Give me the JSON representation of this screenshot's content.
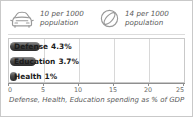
{
  "widget": {
    "border_color": "#c9c9c9",
    "background": "#ffffff"
  },
  "stats": [
    {
      "icon": "car-icon",
      "value": "10 per 1000",
      "unit": "population"
    },
    {
      "icon": "satellite-dish-icon",
      "value": "14 per 1000",
      "unit": "population"
    }
  ],
  "chart_data": {
    "type": "bar",
    "orientation": "horizontal",
    "title": "",
    "caption": "Defense, Health, Education spending as % of GDP",
    "xlabel": "",
    "ylabel": "",
    "categories": [
      "Defense",
      "Education",
      "Health"
    ],
    "values": [
      4.3,
      3.7,
      1
    ],
    "value_labels": [
      "4.3%",
      "3.7%",
      "1%"
    ],
    "xlim": [
      0,
      25
    ],
    "ticks": [
      0,
      5,
      10,
      15,
      20,
      25
    ],
    "tick_labels": [
      "0",
      "5",
      "10",
      "15",
      "20",
      "25"
    ],
    "gridlines": [
      5,
      10,
      15,
      20
    ],
    "grid": true,
    "legend": "none",
    "bar_color": "#3a3a3a",
    "grid_color": "#d8d8d8",
    "axis_color": "#8f8f8f"
  }
}
